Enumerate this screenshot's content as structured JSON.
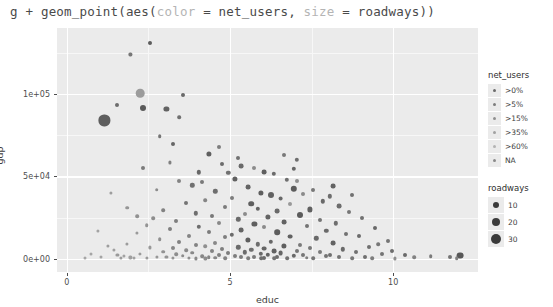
{
  "code_line": {
    "prefix": "g + geom_point(aes(",
    "arg1_name": "color",
    "arg1_mid": " = net_users, ",
    "arg2_name": "size",
    "arg2_tail": " = roadways))"
  },
  "chart_data": {
    "type": "scatter",
    "title": "",
    "xlabel": "educ",
    "ylabel": "gdp",
    "xlim": [
      -0.3,
      12.6
    ],
    "ylim": [
      -8000,
      140000
    ],
    "xticks": [
      0,
      5,
      10
    ],
    "xtick_labels": [
      "0",
      "5",
      "10"
    ],
    "yticks": [
      0,
      50000,
      100000
    ],
    "ytick_labels": [
      "0e+00",
      "5e+04",
      "1e+05"
    ],
    "x_minor": [
      2.5,
      7.5
    ],
    "y_minor": [
      25000,
      75000,
      125000
    ],
    "grid": true,
    "panel_color": "#ebebeb",
    "grid_major_color": "#ffffff",
    "grid_minor_color": "#f7f7f7",
    "legend_position": "right",
    "color_legend": {
      "title": "net_users",
      "entries": [
        {
          "label": ">0%",
          "color": "#6b6b6b"
        },
        {
          "label": ">5%",
          "color": "#7d7d7d"
        },
        {
          "label": ">15%",
          "color": "#8f8f8f"
        },
        {
          "label": ">35%",
          "color": "#a1a1a1"
        },
        {
          "label": ">60%",
          "color": "#b3b3b3"
        },
        {
          "label": "NA",
          "color": "#8a8a8a"
        }
      ]
    },
    "size_legend": {
      "title": "roadways",
      "entries": [
        {
          "label": "10",
          "radius": 3.0
        },
        {
          "label": "20",
          "radius": 4.2
        },
        {
          "label": "30",
          "radius": 5.4
        }
      ]
    },
    "points": [
      {
        "x": 2.55,
        "y": 131000,
        "r": 2.0,
        "c": "#5c5c5c"
      },
      {
        "x": 1.95,
        "y": 124000,
        "r": 1.6,
        "c": "#777777"
      },
      {
        "x": 2.25,
        "y": 100500,
        "r": 4.3,
        "c": "#9c9c9c"
      },
      {
        "x": 3.55,
        "y": 99500,
        "r": 2.0,
        "c": "#6a6a6a"
      },
      {
        "x": 1.55,
        "y": 93000,
        "r": 2.0,
        "c": "#6d6d6d"
      },
      {
        "x": 2.35,
        "y": 91500,
        "r": 3.0,
        "c": "#5a5a5a"
      },
      {
        "x": 3.05,
        "y": 91000,
        "r": 2.6,
        "c": "#626262"
      },
      {
        "x": 1.15,
        "y": 84000,
        "r": 5.6,
        "c": "#5e5e5e"
      },
      {
        "x": 3.45,
        "y": 86000,
        "r": 1.8,
        "c": "#707070"
      },
      {
        "x": 2.85,
        "y": 74500,
        "r": 1.8,
        "c": "#757575"
      },
      {
        "x": 3.25,
        "y": 69500,
        "r": 2.0,
        "c": "#666666"
      },
      {
        "x": 4.35,
        "y": 63500,
        "r": 2.6,
        "c": "#5f5f5f"
      },
      {
        "x": 3.15,
        "y": 58500,
        "r": 1.6,
        "c": "#808080"
      },
      {
        "x": 4.75,
        "y": 57500,
        "r": 2.0,
        "c": "#6c6c6c"
      },
      {
        "x": 5.35,
        "y": 56000,
        "r": 2.4,
        "c": "#6a6a6a"
      },
      {
        "x": 5.75,
        "y": 55000,
        "r": 2.0,
        "c": "#8b8b8b"
      },
      {
        "x": 4.95,
        "y": 52000,
        "r": 2.2,
        "c": "#717171"
      },
      {
        "x": 6.05,
        "y": 52500,
        "r": 2.4,
        "c": "#5f5f5f"
      },
      {
        "x": 6.35,
        "y": 51500,
        "r": 2.2,
        "c": "#6b6b6b"
      },
      {
        "x": 5.15,
        "y": 48500,
        "r": 2.6,
        "c": "#616161"
      },
      {
        "x": 6.75,
        "y": 48000,
        "r": 2.2,
        "c": "#6f6f6f"
      },
      {
        "x": 4.15,
        "y": 46500,
        "r": 2.0,
        "c": "#7a7a7a"
      },
      {
        "x": 7.05,
        "y": 47500,
        "r": 2.0,
        "c": "#8e8e8e"
      },
      {
        "x": 3.85,
        "y": 44500,
        "r": 2.2,
        "c": "#707070"
      },
      {
        "x": 5.55,
        "y": 43500,
        "r": 2.4,
        "c": "#646464"
      },
      {
        "x": 6.95,
        "y": 42500,
        "r": 3.2,
        "c": "#5c5c5c"
      },
      {
        "x": 7.55,
        "y": 42000,
        "r": 2.0,
        "c": "#787878"
      },
      {
        "x": 4.55,
        "y": 41000,
        "r": 2.2,
        "c": "#6e6e6e"
      },
      {
        "x": 5.95,
        "y": 40000,
        "r": 2.6,
        "c": "#5d5d5d"
      },
      {
        "x": 7.25,
        "y": 39500,
        "r": 2.0,
        "c": "#8a8a8a"
      },
      {
        "x": 6.25,
        "y": 38500,
        "r": 3.0,
        "c": "#616161"
      },
      {
        "x": 8.05,
        "y": 38000,
        "r": 2.2,
        "c": "#6d6d6d"
      },
      {
        "x": 5.05,
        "y": 37000,
        "r": 2.0,
        "c": "#7d7d7d"
      },
      {
        "x": 6.55,
        "y": 36500,
        "r": 2.4,
        "c": "#676767"
      },
      {
        "x": 4.25,
        "y": 35500,
        "r": 1.8,
        "c": "#858585"
      },
      {
        "x": 7.85,
        "y": 35000,
        "r": 2.2,
        "c": "#696969"
      },
      {
        "x": 3.65,
        "y": 34000,
        "r": 2.0,
        "c": "#747474"
      },
      {
        "x": 5.65,
        "y": 33500,
        "r": 2.8,
        "c": "#5e5e5e"
      },
      {
        "x": 6.85,
        "y": 33000,
        "r": 2.0,
        "c": "#999999"
      },
      {
        "x": 8.35,
        "y": 32000,
        "r": 2.4,
        "c": "#6c6c6c"
      },
      {
        "x": 4.85,
        "y": 31500,
        "r": 2.0,
        "c": "#7b7b7b"
      },
      {
        "x": 5.85,
        "y": 30500,
        "r": 2.2,
        "c": "#656565"
      },
      {
        "x": 7.45,
        "y": 30000,
        "r": 2.6,
        "c": "#606060"
      },
      {
        "x": 2.95,
        "y": 29500,
        "r": 1.8,
        "c": "#828282"
      },
      {
        "x": 6.45,
        "y": 29000,
        "r": 2.4,
        "c": "#6a6a6a"
      },
      {
        "x": 8.65,
        "y": 28500,
        "r": 2.0,
        "c": "#767676"
      },
      {
        "x": 3.95,
        "y": 27500,
        "r": 2.2,
        "c": "#6f6f6f"
      },
      {
        "x": 5.45,
        "y": 27000,
        "r": 2.0,
        "c": "#8c8c8c"
      },
      {
        "x": 7.15,
        "y": 26500,
        "r": 3.0,
        "c": "#5b5b5b"
      },
      {
        "x": 4.45,
        "y": 26000,
        "r": 2.0,
        "c": "#797979"
      },
      {
        "x": 6.15,
        "y": 25500,
        "r": 2.6,
        "c": "#636363"
      },
      {
        "x": 9.05,
        "y": 25000,
        "r": 2.0,
        "c": "#717171"
      },
      {
        "x": 2.65,
        "y": 24500,
        "r": 1.8,
        "c": "#8d8d8d"
      },
      {
        "x": 5.25,
        "y": 24000,
        "r": 2.2,
        "c": "#6b6b6b"
      },
      {
        "x": 7.75,
        "y": 23500,
        "r": 2.0,
        "c": "#757575"
      },
      {
        "x": 3.35,
        "y": 23000,
        "r": 2.0,
        "c": "#7f7f7f"
      },
      {
        "x": 6.65,
        "y": 22500,
        "r": 2.4,
        "c": "#626262"
      },
      {
        "x": 4.65,
        "y": 22000,
        "r": 2.0,
        "c": "#888888"
      },
      {
        "x": 8.25,
        "y": 21500,
        "r": 2.2,
        "c": "#6e6e6e"
      },
      {
        "x": 5.75,
        "y": 21000,
        "r": 2.6,
        "c": "#5f5f5f"
      },
      {
        "x": 2.45,
        "y": 20500,
        "r": 1.8,
        "c": "#949494"
      },
      {
        "x": 7.35,
        "y": 20000,
        "r": 2.0,
        "c": "#737373"
      },
      {
        "x": 4.05,
        "y": 19500,
        "r": 2.2,
        "c": "#6d6d6d"
      },
      {
        "x": 6.05,
        "y": 19000,
        "r": 2.0,
        "c": "#8a8a8a"
      },
      {
        "x": 9.45,
        "y": 18500,
        "r": 2.0,
        "c": "#686868"
      },
      {
        "x": 3.15,
        "y": 18000,
        "r": 2.0,
        "c": "#808080"
      },
      {
        "x": 5.35,
        "y": 17500,
        "r": 2.4,
        "c": "#646464"
      },
      {
        "x": 7.95,
        "y": 17000,
        "r": 2.2,
        "c": "#6a6a6a"
      },
      {
        "x": 4.35,
        "y": 16500,
        "r": 2.0,
        "c": "#7c7c7c"
      },
      {
        "x": 6.45,
        "y": 16000,
        "r": 2.8,
        "c": "#5d5d5d"
      },
      {
        "x": 2.15,
        "y": 15500,
        "r": 1.6,
        "c": "#9a9a9a"
      },
      {
        "x": 8.55,
        "y": 15000,
        "r": 2.0,
        "c": "#727272"
      },
      {
        "x": 5.05,
        "y": 14500,
        "r": 2.2,
        "c": "#6c6c6c"
      },
      {
        "x": 3.75,
        "y": 14000,
        "r": 2.0,
        "c": "#858585"
      },
      {
        "x": 6.85,
        "y": 13500,
        "r": 2.4,
        "c": "#616161"
      },
      {
        "x": 4.85,
        "y": 13000,
        "r": 2.0,
        "c": "#7e7e7e"
      },
      {
        "x": 7.65,
        "y": 12500,
        "r": 2.2,
        "c": "#696969"
      },
      {
        "x": 2.85,
        "y": 12000,
        "r": 1.8,
        "c": "#8f8f8f"
      },
      {
        "x": 5.55,
        "y": 11500,
        "r": 2.6,
        "c": "#5e5e5e"
      },
      {
        "x": 9.85,
        "y": 11000,
        "r": 2.0,
        "c": "#747474"
      },
      {
        "x": 3.45,
        "y": 10500,
        "r": 2.0,
        "c": "#818181"
      },
      {
        "x": 6.25,
        "y": 10200,
        "r": 2.2,
        "c": "#676767"
      },
      {
        "x": 4.55,
        "y": 9800,
        "r": 2.0,
        "c": "#888888"
      },
      {
        "x": 8.15,
        "y": 9500,
        "r": 2.4,
        "c": "#636363"
      },
      {
        "x": 1.85,
        "y": 9200,
        "r": 1.6,
        "c": "#9c9c9c"
      },
      {
        "x": 5.85,
        "y": 8900,
        "r": 2.2,
        "c": "#6d6d6d"
      },
      {
        "x": 7.15,
        "y": 8600,
        "r": 2.0,
        "c": "#7a7a7a"
      },
      {
        "x": 3.95,
        "y": 8300,
        "r": 2.0,
        "c": "#838383"
      },
      {
        "x": 6.65,
        "y": 8000,
        "r": 2.6,
        "c": "#5f5f5f"
      },
      {
        "x": 4.25,
        "y": 7700,
        "r": 1.8,
        "c": "#909090"
      },
      {
        "x": 9.25,
        "y": 7400,
        "r": 2.0,
        "c": "#707070"
      },
      {
        "x": 5.25,
        "y": 7100,
        "r": 2.2,
        "c": "#6b6b6b"
      },
      {
        "x": 2.55,
        "y": 6900,
        "r": 1.6,
        "c": "#989898"
      },
      {
        "x": 7.45,
        "y": 6700,
        "r": 2.0,
        "c": "#787878"
      },
      {
        "x": 3.25,
        "y": 6400,
        "r": 2.0,
        "c": "#868686"
      },
      {
        "x": 6.05,
        "y": 6200,
        "r": 2.4,
        "c": "#656565"
      },
      {
        "x": 4.75,
        "y": 6000,
        "r": 2.0,
        "c": "#7f7f7f"
      },
      {
        "x": 8.45,
        "y": 5800,
        "r": 2.2,
        "c": "#6a6a6a"
      },
      {
        "x": 1.45,
        "y": 5600,
        "r": 1.6,
        "c": "#a0a0a0"
      },
      {
        "x": 5.65,
        "y": 5400,
        "r": 2.2,
        "c": "#6e6e6e"
      },
      {
        "x": 3.65,
        "y": 5200,
        "r": 1.8,
        "c": "#8b8b8b"
      },
      {
        "x": 7.05,
        "y": 5000,
        "r": 2.0,
        "c": "#767676"
      },
      {
        "x": 6.35,
        "y": 4800,
        "r": 2.4,
        "c": "#626262"
      },
      {
        "x": 4.45,
        "y": 4600,
        "r": 2.0,
        "c": "#848484"
      },
      {
        "x": 2.95,
        "y": 4400,
        "r": 1.8,
        "c": "#929292"
      },
      {
        "x": 8.85,
        "y": 4200,
        "r": 2.0,
        "c": "#717171"
      },
      {
        "x": 5.45,
        "y": 4000,
        "r": 2.2,
        "c": "#6c6c6c"
      },
      {
        "x": 7.75,
        "y": 3900,
        "r": 2.0,
        "c": "#7b7b7b"
      },
      {
        "x": 3.85,
        "y": 3700,
        "r": 1.8,
        "c": "#898989"
      },
      {
        "x": 6.55,
        "y": 3500,
        "r": 2.4,
        "c": "#666666"
      },
      {
        "x": 4.95,
        "y": 3300,
        "r": 2.0,
        "c": "#7d7d7d"
      },
      {
        "x": 2.25,
        "y": 3200,
        "r": 1.6,
        "c": "#9b9b9b"
      },
      {
        "x": 5.95,
        "y": 3000,
        "r": 2.2,
        "c": "#696969"
      },
      {
        "x": 9.65,
        "y": 2900,
        "r": 2.0,
        "c": "#747474"
      },
      {
        "x": 3.35,
        "y": 2700,
        "r": 1.8,
        "c": "#8e8e8e"
      },
      {
        "x": 7.25,
        "y": 2600,
        "r": 2.0,
        "c": "#777777"
      },
      {
        "x": 4.65,
        "y": 2400,
        "r": 2.0,
        "c": "#828282"
      },
      {
        "x": 6.15,
        "y": 2300,
        "r": 2.2,
        "c": "#646464"
      },
      {
        "x": 8.05,
        "y": 2100,
        "r": 2.0,
        "c": "#6f6f6f"
      },
      {
        "x": 1.75,
        "y": 2000,
        "r": 1.6,
        "c": "#a2a2a2"
      },
      {
        "x": 5.15,
        "y": 1900,
        "r": 2.0,
        "c": "#7e7e7e"
      },
      {
        "x": 3.55,
        "y": 1800,
        "r": 1.8,
        "c": "#8c8c8c"
      },
      {
        "x": 6.95,
        "y": 1700,
        "r": 2.2,
        "c": "#686868"
      },
      {
        "x": 4.15,
        "y": 1600,
        "r": 1.8,
        "c": "#878787"
      },
      {
        "x": 7.95,
        "y": 1500,
        "r": 2.0,
        "c": "#737373"
      },
      {
        "x": 2.75,
        "y": 1400,
        "r": 1.6,
        "c": "#979797"
      },
      {
        "x": 5.75,
        "y": 1300,
        "r": 2.0,
        "c": "#7a7a7a"
      },
      {
        "x": 9.15,
        "y": 1200,
        "r": 2.0,
        "c": "#707070"
      },
      {
        "x": 3.05,
        "y": 1100,
        "r": 1.6,
        "c": "#939393"
      },
      {
        "x": 6.45,
        "y": 1000,
        "r": 2.0,
        "c": "#6d6d6d"
      },
      {
        "x": 4.35,
        "y": 950,
        "r": 1.8,
        "c": "#858585"
      },
      {
        "x": 8.35,
        "y": 900,
        "r": 2.0,
        "c": "#757575"
      },
      {
        "x": 1.95,
        "y": 850,
        "r": 1.6,
        "c": "#9f9f9f"
      },
      {
        "x": 5.35,
        "y": 800,
        "r": 2.0,
        "c": "#7c7c7c"
      },
      {
        "x": 7.35,
        "y": 750,
        "r": 1.8,
        "c": "#818181"
      },
      {
        "x": 3.75,
        "y": 700,
        "r": 1.6,
        "c": "#909090"
      },
      {
        "x": 6.05,
        "y": 650,
        "r": 2.0,
        "c": "#6b6b6b"
      },
      {
        "x": 4.55,
        "y": 600,
        "r": 1.8,
        "c": "#888888"
      },
      {
        "x": 2.45,
        "y": 550,
        "r": 1.6,
        "c": "#9a9a9a"
      },
      {
        "x": 8.75,
        "y": 500,
        "r": 1.8,
        "c": "#787878"
      },
      {
        "x": 5.55,
        "y": 450,
        "r": 1.8,
        "c": "#7f7f7f"
      },
      {
        "x": 6.75,
        "y": 420,
        "r": 1.8,
        "c": "#727272"
      },
      {
        "x": 3.25,
        "y": 400,
        "r": 1.6,
        "c": "#959595"
      },
      {
        "x": 4.85,
        "y": 370,
        "r": 1.8,
        "c": "#838383"
      },
      {
        "x": 7.55,
        "y": 340,
        "r": 1.8,
        "c": "#767676"
      },
      {
        "x": 2.05,
        "y": 320,
        "r": 1.5,
        "c": "#a1a1a1"
      },
      {
        "x": 5.95,
        "y": 300,
        "r": 1.8,
        "c": "#6e6e6e"
      },
      {
        "x": 3.95,
        "y": 280,
        "r": 1.6,
        "c": "#8a8a8a"
      },
      {
        "x": 6.35,
        "y": 250,
        "r": 1.8,
        "c": "#747474"
      },
      {
        "x": 4.25,
        "y": 230,
        "r": 1.6,
        "c": "#8d8d8d"
      },
      {
        "x": 1.35,
        "y": 40000,
        "r": 1.6,
        "c": "#9e9e9e"
      },
      {
        "x": 0.95,
        "y": 17000,
        "r": 1.6,
        "c": "#a3a3a3"
      },
      {
        "x": 1.25,
        "y": 8000,
        "r": 1.6,
        "c": "#9d9d9d"
      },
      {
        "x": 0.75,
        "y": 3000,
        "r": 1.5,
        "c": "#a5a5a5"
      },
      {
        "x": 1.55,
        "y": 2200,
        "r": 1.6,
        "c": "#999999"
      },
      {
        "x": 1.05,
        "y": 1200,
        "r": 1.5,
        "c": "#a4a4a4"
      },
      {
        "x": 1.65,
        "y": 600,
        "r": 1.6,
        "c": "#9b9b9b"
      },
      {
        "x": 0.55,
        "y": 400,
        "r": 1.5,
        "c": "#a6a6a6"
      },
      {
        "x": 10.35,
        "y": 2400,
        "r": 2.0,
        "c": "#6a6a6a"
      },
      {
        "x": 11.15,
        "y": 1500,
        "r": 1.8,
        "c": "#7a7a7a"
      },
      {
        "x": 10.65,
        "y": 800,
        "r": 1.8,
        "c": "#828282"
      },
      {
        "x": 9.95,
        "y": 5000,
        "r": 2.0,
        "c": "#6d6d6d"
      },
      {
        "x": 12.05,
        "y": 2000,
        "r": 3.4,
        "c": "#585858"
      },
      {
        "x": 11.75,
        "y": 1400,
        "r": 2.0,
        "c": "#757575"
      },
      {
        "x": 11.95,
        "y": 300,
        "r": 1.8,
        "c": "#808080"
      },
      {
        "x": 10.05,
        "y": 300,
        "r": 1.6,
        "c": "#8f8f8f"
      },
      {
        "x": 9.35,
        "y": 450,
        "r": 1.8,
        "c": "#7d7d7d"
      },
      {
        "x": 8.95,
        "y": 13800,
        "r": 2.0,
        "c": "#6b6b6b"
      },
      {
        "x": 9.55,
        "y": 9000,
        "r": 1.8,
        "c": "#777777"
      },
      {
        "x": 8.15,
        "y": 44000,
        "r": 2.4,
        "c": "#636363"
      },
      {
        "x": 7.05,
        "y": 60000,
        "r": 2.2,
        "c": "#6e6e6e"
      },
      {
        "x": 6.65,
        "y": 63000,
        "r": 2.0,
        "c": "#797979"
      },
      {
        "x": 8.75,
        "y": 39000,
        "r": 2.0,
        "c": "#717171"
      },
      {
        "x": 2.35,
        "y": 55000,
        "r": 2.0,
        "c": "#7b7b7b"
      },
      {
        "x": 4.05,
        "y": 52500,
        "r": 2.2,
        "c": "#686868"
      },
      {
        "x": 3.45,
        "y": 47000,
        "r": 2.0,
        "c": "#838383"
      },
      {
        "x": 2.75,
        "y": 42000,
        "r": 1.8,
        "c": "#8c8c8c"
      },
      {
        "x": 1.85,
        "y": 31000,
        "r": 1.8,
        "c": "#959595"
      },
      {
        "x": 2.15,
        "y": 26000,
        "r": 1.8,
        "c": "#919191"
      },
      {
        "x": 6.95,
        "y": 54500,
        "r": 2.2,
        "c": "#666666"
      },
      {
        "x": 5.25,
        "y": 61000,
        "r": 2.0,
        "c": "#727272"
      },
      {
        "x": 4.65,
        "y": 68000,
        "r": 2.0,
        "c": "#7e7e7e"
      }
    ]
  }
}
